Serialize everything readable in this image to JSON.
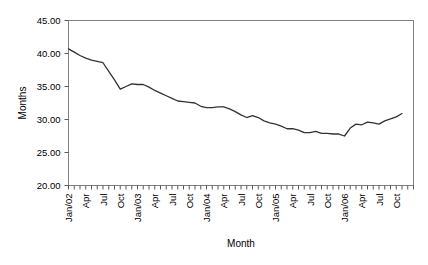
{
  "chart_data": {
    "type": "line",
    "title": "",
    "xlabel": "Month",
    "ylabel": "Months",
    "ylim": [
      20.0,
      45.0
    ],
    "yticks": [
      20.0,
      25.0,
      30.0,
      35.0,
      40.0,
      45.0
    ],
    "ytick_labels": [
      "20.00",
      "25.00",
      "30.00",
      "35.00",
      "40.00",
      "45.00"
    ],
    "grid": false,
    "legend": false,
    "x_tick_interval_months": 1,
    "x_label_interval_months": 3,
    "x_labels": [
      "Jan/02",
      "Apr",
      "Jul",
      "Oct",
      "Jan/03",
      "Apr",
      "Jul",
      "Oct",
      "Jan/04",
      "Apr",
      "Jul",
      "Oct",
      "Jan/05",
      "Apr",
      "Jul",
      "Oct",
      "Jan/06",
      "Apr",
      "Jul",
      "Oct"
    ],
    "x": [
      "Jan/02",
      "Feb/02",
      "Mar/02",
      "Apr/02",
      "May/02",
      "Jun/02",
      "Jul/02",
      "Aug/02",
      "Sep/02",
      "Oct/02",
      "Nov/02",
      "Dec/02",
      "Jan/03",
      "Feb/03",
      "Mar/03",
      "Apr/03",
      "May/03",
      "Jun/03",
      "Jul/03",
      "Aug/03",
      "Sep/03",
      "Oct/03",
      "Nov/03",
      "Dec/03",
      "Jan/04",
      "Feb/04",
      "Mar/04",
      "Apr/04",
      "May/04",
      "Jun/04",
      "Jul/04",
      "Aug/04",
      "Sep/04",
      "Oct/04",
      "Nov/04",
      "Dec/04",
      "Jan/05",
      "Feb/05",
      "Mar/05",
      "Apr/05",
      "May/05",
      "Jun/05",
      "Jul/05",
      "Aug/05",
      "Sep/05",
      "Oct/05",
      "Nov/05",
      "Dec/05",
      "Jan/06",
      "Feb/06",
      "Mar/06",
      "Apr/06",
      "May/06",
      "Jun/06",
      "Jul/06",
      "Aug/06",
      "Sep/06",
      "Oct/06",
      "Nov/06"
    ],
    "values": [
      40.7,
      40.2,
      39.7,
      39.3,
      39.0,
      38.8,
      38.6,
      37.3,
      36.0,
      34.6,
      35.0,
      35.4,
      35.3,
      35.3,
      34.9,
      34.4,
      34.0,
      33.6,
      33.2,
      32.8,
      32.7,
      32.6,
      32.5,
      32.0,
      31.8,
      31.8,
      31.9,
      31.9,
      31.6,
      31.2,
      30.7,
      30.3,
      30.6,
      30.3,
      29.8,
      29.5,
      29.3,
      29.0,
      28.6,
      28.6,
      28.4,
      28.0,
      28.0,
      28.2,
      27.9,
      27.9,
      27.8,
      27.8,
      27.5,
      28.7,
      29.3,
      29.2,
      29.6,
      29.5,
      29.3,
      29.8,
      30.1,
      30.4,
      30.9
    ],
    "series_name": "Months"
  },
  "axes": {
    "y_title": "Months",
    "x_title": "Month"
  }
}
